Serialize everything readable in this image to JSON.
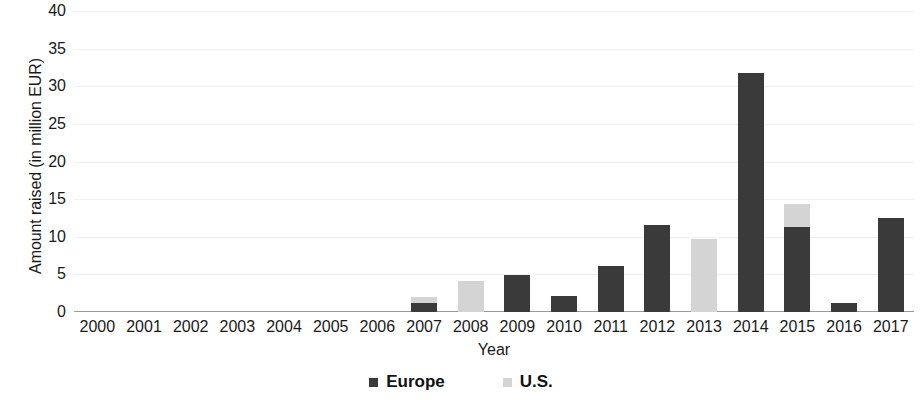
{
  "chart_data": {
    "type": "bar",
    "subtype": "stacked-column",
    "title": "",
    "xlabel": "Year",
    "ylabel": "Amount raised (in million EUR)",
    "categories": [
      "2000",
      "2001",
      "2002",
      "2003",
      "2004",
      "2005",
      "2006",
      "2007",
      "2008",
      "2009",
      "2010",
      "2011",
      "2012",
      "2013",
      "2014",
      "2015",
      "2016",
      "2017"
    ],
    "series": [
      {
        "name": "Europe",
        "color": "#3a3a3a",
        "values": [
          0,
          0,
          0,
          0,
          0,
          0,
          0,
          1.2,
          0,
          4.9,
          2.1,
          6.1,
          11.6,
          0,
          31.7,
          11.3,
          1.2,
          12.5
        ]
      },
      {
        "name": "U.S.",
        "color": "#d4d4d4",
        "values": [
          0,
          0,
          0,
          0,
          0,
          0,
          0,
          0.8,
          4.1,
          0,
          0,
          0,
          0,
          9.7,
          0,
          3.0,
          0,
          0
        ]
      }
    ],
    "ylim": [
      0,
      40
    ],
    "yticks": [
      0,
      5,
      10,
      15,
      20,
      25,
      30,
      35,
      40
    ],
    "ytick_labels": [
      "0",
      "5",
      "10",
      "15",
      "20",
      "25",
      "30",
      "35",
      "40"
    ],
    "grid": false,
    "legend_position": "bottom"
  },
  "legend": {
    "items": [
      {
        "label": "Europe",
        "color": "#3a3a3a"
      },
      {
        "label": "U.S.",
        "color": "#d4d4d4"
      }
    ]
  },
  "colors": {
    "europe": "#3a3a3a",
    "us": "#d4d4d4",
    "axis": "#9a9a9a",
    "text": "#1a1a1a",
    "background": "#ffffff"
  }
}
